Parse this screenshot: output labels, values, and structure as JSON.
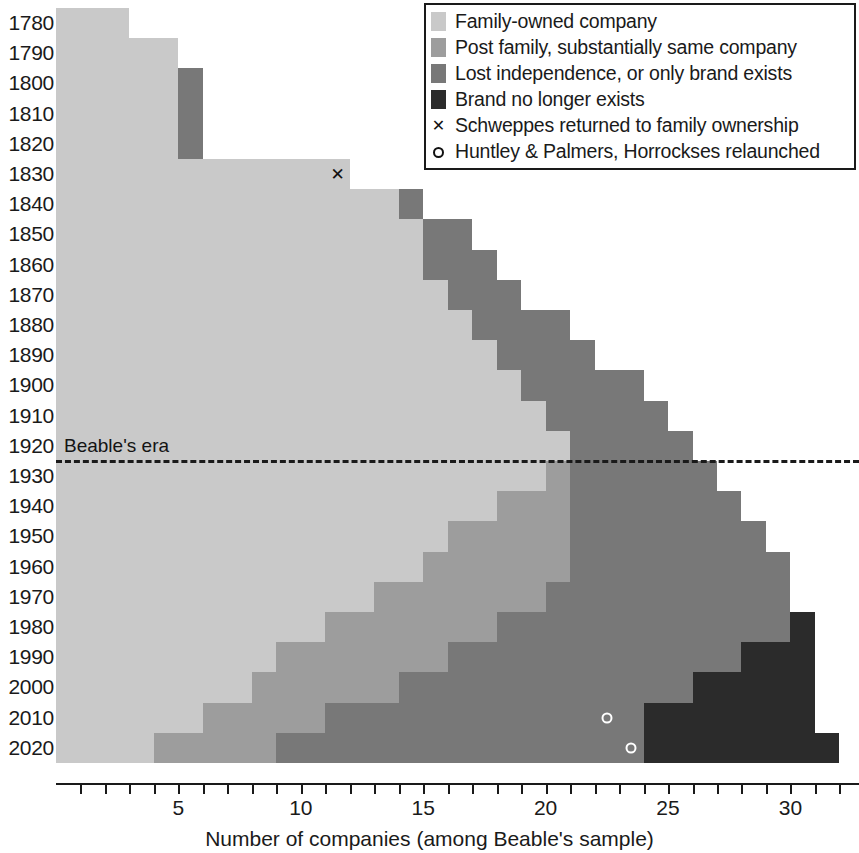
{
  "chart_data": {
    "type": "bar",
    "orientation": "horizontal",
    "stacked": true,
    "title": "",
    "xlabel": "Number of companies (among Beable's sample)",
    "ylabel": "",
    "xlim": [
      0,
      32.8
    ],
    "xticks": [
      1,
      2,
      3,
      4,
      5,
      6,
      7,
      8,
      9,
      10,
      11,
      12,
      13,
      14,
      15,
      16,
      17,
      18,
      19,
      20,
      21,
      22,
      23,
      24,
      25,
      26,
      27,
      28,
      29,
      30,
      31,
      32
    ],
    "xtick_labels": [
      {
        "value": 5,
        "label": "5"
      },
      {
        "value": 10,
        "label": "10"
      },
      {
        "value": 15,
        "label": "15"
      },
      {
        "value": 20,
        "label": "20"
      },
      {
        "value": 25,
        "label": "25"
      },
      {
        "value": 30,
        "label": "30"
      }
    ],
    "grid": false,
    "legend_position": "top-right",
    "categories": [
      "1780",
      "1790",
      "1800",
      "1810",
      "1820",
      "1830",
      "1840",
      "1850",
      "1860",
      "1870",
      "1880",
      "1890",
      "1900",
      "1910",
      "1920",
      "1930",
      "1940",
      "1950",
      "1960",
      "1970",
      "1980",
      "1990",
      "2000",
      "2010",
      "2020"
    ],
    "series": [
      {
        "name": "Family-owned company",
        "color": "#c9c9c9",
        "values": [
          3,
          5,
          5,
          5,
          5,
          12,
          14,
          15,
          15,
          16,
          17,
          18,
          19,
          20,
          21,
          20,
          18,
          16,
          15,
          13,
          11,
          9,
          8,
          6,
          4
        ]
      },
      {
        "name": "Post family, substantially same company",
        "color": "#9d9d9d",
        "values": [
          0,
          0,
          0,
          0,
          0,
          0,
          0,
          0,
          0,
          0,
          0,
          0,
          0,
          0,
          0,
          1,
          3,
          5,
          6,
          7,
          7,
          7,
          6,
          5,
          5
        ]
      },
      {
        "name": "Lost independence, or only brand exists",
        "color": "#787878",
        "values": [
          0,
          0,
          1,
          1,
          1,
          0,
          1,
          2,
          3,
          3,
          4,
          4,
          5,
          5,
          5,
          6,
          7,
          8,
          9,
          10,
          12,
          12,
          12,
          13,
          15
        ]
      },
      {
        "name": "Brand no longer exists",
        "color": "#2b2b2b",
        "values": [
          0,
          0,
          0,
          0,
          0,
          0,
          0,
          0,
          0,
          0,
          0,
          0,
          0,
          0,
          0,
          0,
          0,
          0,
          0,
          0,
          1,
          3,
          5,
          7,
          8
        ]
      }
    ],
    "row_totals": [
      3,
      5,
      6,
      6,
      6,
      12,
      15,
      17,
      18,
      19,
      21,
      22,
      24,
      25,
      26,
      27,
      28,
      29,
      30,
      30,
      31,
      31,
      31,
      31,
      32
    ],
    "annotations": [
      {
        "name": "beable-era-line",
        "type": "hline",
        "label": "Beable's era",
        "between": [
          "1920",
          "1930"
        ],
        "style": "dashed",
        "color": "#1a1a1a"
      },
      {
        "name": "schweppes-marker",
        "type": "point",
        "marker": "x",
        "row": "1830",
        "x": 11.5,
        "color": "#111111"
      },
      {
        "name": "huntley-palmers-marker",
        "type": "point",
        "marker": "o",
        "row": "2010",
        "x": 22.5,
        "color": "#ffffff"
      },
      {
        "name": "horrockses-marker",
        "type": "point",
        "marker": "o",
        "row": "2020",
        "x": 23.5,
        "color": "#ffffff"
      }
    ],
    "legend": [
      {
        "kind": "swatch",
        "color": "#c9c9c9",
        "label": "Family-owned company"
      },
      {
        "kind": "swatch",
        "color": "#9d9d9d",
        "label": "Post family, substantially same company"
      },
      {
        "kind": "swatch",
        "color": "#787878",
        "label": "Lost independence, or only brand exists"
      },
      {
        "kind": "swatch",
        "color": "#2b2b2b",
        "label": "Brand no longer exists"
      },
      {
        "kind": "cross",
        "color": "#111111",
        "label": "Schweppes returned to family ownership"
      },
      {
        "kind": "circle",
        "color": "#111111",
        "label": "Huntley & Palmers, Horrockses relaunched"
      }
    ]
  },
  "axes": {
    "x_title": "Number of companies (among Beable's sample)"
  },
  "era": {
    "label": "Beable's era"
  },
  "markers": {
    "cross_glyph": "✕",
    "circle_glyph": "○"
  }
}
